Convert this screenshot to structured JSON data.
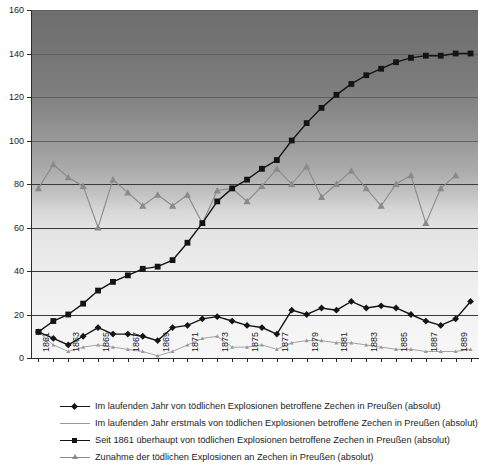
{
  "chart_data": {
    "type": "line",
    "title": "",
    "subtitle": "",
    "xlabel": "",
    "ylabel": "",
    "ylim": [
      0,
      160
    ],
    "ytick_step": 20,
    "yticks": [
      0,
      20,
      40,
      60,
      80,
      100,
      120,
      140,
      160
    ],
    "grid": true,
    "grid_orientation": "horizontal",
    "legend_position": "bottom",
    "x": [
      1861,
      1862,
      1863,
      1864,
      1865,
      1866,
      1867,
      1868,
      1869,
      1870,
      1871,
      1872,
      1873,
      1874,
      1875,
      1876,
      1877,
      1878,
      1879,
      1880,
      1881,
      1882,
      1883,
      1884,
      1885,
      1886,
      1887,
      1888,
      1889,
      1890
    ],
    "xtick_labels": [
      "1861",
      "1863",
      "1865",
      "1867",
      "1869",
      "1871",
      "1873",
      "1875",
      "1877",
      "1879",
      "1881",
      "1883",
      "1885",
      "1887",
      "1889"
    ],
    "xtick_label_rotation": -90,
    "series": [
      {
        "name": "Im laufenden Jahr von tödlichen Explosionen betroffene Zechen in Preußen (absolut)",
        "marker": "diamond",
        "color": "#141414",
        "values": [
          12,
          9,
          6,
          10,
          14,
          11,
          11,
          10,
          8,
          14,
          15,
          18,
          19,
          17,
          15,
          14,
          11,
          22,
          20,
          23,
          22,
          26,
          23,
          24,
          23,
          20,
          17,
          15,
          18,
          26
        ]
      },
      {
        "name": "Im laufenden Jahr erstmals von tödlichen Explosionen betroffene Zechen in Preußen (absolut)",
        "marker": "small-triangle",
        "color": "#9a9a9a",
        "values": [
          12,
          6,
          3,
          5,
          6,
          5,
          4,
          3,
          1,
          3,
          6,
          9,
          10,
          5,
          5,
          6,
          4,
          7,
          8,
          8,
          7,
          7,
          6,
          5,
          4,
          4,
          3,
          3,
          3,
          4
        ]
      },
      {
        "name": "Seit 1861 überhaupt von tödlichen Explosionen betroffene Zechen in Preußen (absolut)",
        "marker": "square",
        "color": "#141414",
        "values": [
          12,
          17,
          20,
          25,
          31,
          35,
          38,
          41,
          42,
          45,
          53,
          62,
          72,
          78,
          82,
          87,
          91,
          100,
          108,
          115,
          121,
          126,
          130,
          133,
          136,
          138,
          139,
          139,
          140,
          140
        ]
      },
      {
        "name": "Zunahme der tödlichen Explosionen an Zechen in Preußen (absolut)",
        "marker": "triangle",
        "color": "#8a8a8a",
        "values": [
          78,
          89,
          83,
          79,
          60,
          82,
          76,
          70,
          75,
          70,
          75,
          62,
          77,
          78,
          72,
          79,
          87,
          80,
          88,
          74,
          80,
          86,
          78,
          70,
          80,
          84,
          62,
          78,
          84,
          null
        ]
      }
    ],
    "annotations": []
  },
  "legend": {
    "entries": [
      {
        "label": "Im laufenden Jahr von tödlichen Explosionen betroffene Zechen in Preußen (absolut)",
        "marker": "diamond",
        "color": "#141414"
      },
      {
        "label": "Im laufenden Jahr erstmals von tödlichen Explosionen betroffene Zechen in Preußen (absolut)",
        "marker": "small-triangle",
        "color": "#9a9a9a"
      },
      {
        "label": "Seit 1861 überhaupt von tödlichen Explosionen betroffene Zechen in Preußen (absolut)",
        "marker": "square",
        "color": "#141414"
      },
      {
        "label": "Zunahme der tödlichen Explosionen an Zechen in Preußen (absolut)",
        "marker": "triangle",
        "color": "#8a8a8a"
      }
    ]
  },
  "colors": {
    "axis": "#2b2b2b",
    "gridline": "#3a3a3a",
    "plot_bg_top": "#6e6e6e",
    "plot_bg_bottom": "#f7f7f7",
    "text": "#1b1b1b"
  }
}
